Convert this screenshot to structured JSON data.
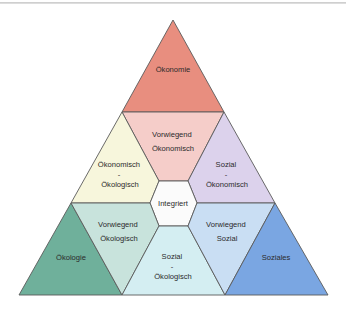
{
  "diagram": {
    "type": "triangle-diagram",
    "regions": {
      "oekonomie": {
        "lines": [
          "Ökonomie"
        ],
        "color": "#e88e7f"
      },
      "vorwiegend_oekonomisch": {
        "lines": [
          "Vorwiegend",
          "Ökonomisch"
        ],
        "color": "#f5cdc9"
      },
      "oekonomisch_oekologisch": {
        "lines": [
          "Ökonomisch",
          "-",
          "Ökologisch"
        ],
        "color": "#f7f6dc"
      },
      "sozial_oekonomisch": {
        "lines": [
          "Sozial",
          "-",
          "Ökonomisch"
        ],
        "color": "#dcd2ec"
      },
      "integriert": {
        "lines": [
          "Integriert"
        ],
        "color": "#fbfbfb"
      },
      "oekologie": {
        "lines": [
          "Ökologie"
        ],
        "color": "#6fb09b"
      },
      "vorwiegend_oekologisch": {
        "lines": [
          "Vorwiegend",
          "Ökologisch"
        ],
        "color": "#c8e3dc"
      },
      "sozial_oekologisch": {
        "lines": [
          "Sozial",
          "-",
          "Ökologisch"
        ],
        "color": "#d4eef2"
      },
      "vorwiegend_sozial": {
        "lines": [
          "Vorwiegend",
          "Sozial"
        ],
        "color": "#c9def3"
      },
      "soziales": {
        "lines": [
          "Soziales"
        ],
        "color": "#7aa6e2"
      }
    },
    "stroke_color": "#5a5a5a"
  }
}
